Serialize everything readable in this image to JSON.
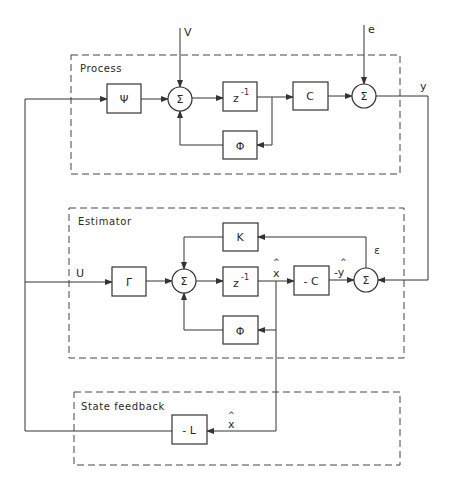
{
  "groups": {
    "process": {
      "label": "Process"
    },
    "estimator": {
      "label": "Estimator"
    },
    "state_feedback": {
      "label": "State feedback"
    }
  },
  "inputs": {
    "v": "V",
    "e": "e",
    "u": "U"
  },
  "signals": {
    "y": "y",
    "epsilon": "ε",
    "x_hat": "x",
    "x_hat_fb": "x",
    "y_hat": "-y",
    "hat": "^"
  },
  "blocks": {
    "psi": "Ψ",
    "z_inv_process": "z",
    "z_inv_estimator": "z",
    "z_exp": "-1",
    "c": "C",
    "phi_process": "Φ",
    "phi_estimator": "Φ",
    "gamma": "Γ",
    "k": "K",
    "minus_c": "- C",
    "minus_l": "- L"
  },
  "sums": {
    "symbol": "Σ"
  }
}
